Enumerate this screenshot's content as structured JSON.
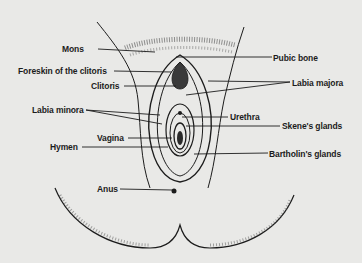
{
  "diagram": {
    "type": "anatomical-illustration",
    "colors": {
      "background": "#e9e9e7",
      "ink": "#1c1c1c"
    },
    "labels_left": [
      {
        "id": "mons",
        "text": "Mons"
      },
      {
        "id": "foreskin",
        "text": "Foreskin of the clitoris"
      },
      {
        "id": "clitoris",
        "text": "Clitoris"
      },
      {
        "id": "labia-minora",
        "text": "Labia minora"
      },
      {
        "id": "vagina",
        "text": "Vagina"
      },
      {
        "id": "hymen",
        "text": "Hymen"
      },
      {
        "id": "anus",
        "text": "Anus"
      }
    ],
    "labels_right": [
      {
        "id": "pubic-bone",
        "text": "Pubic bone"
      },
      {
        "id": "labia-majora",
        "text": "Labia majora"
      },
      {
        "id": "urethra",
        "text": "Urethra"
      },
      {
        "id": "skenes-glands",
        "text": "Skene's glands"
      },
      {
        "id": "bartholins-glands",
        "text": "Bartholin's glands"
      }
    ]
  }
}
